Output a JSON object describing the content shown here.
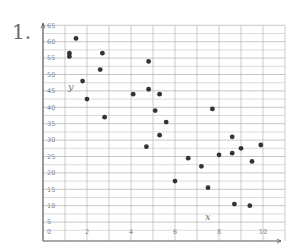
{
  "problem": {
    "number": "1."
  },
  "chart_data": {
    "type": "scatter",
    "title": "",
    "xlabel": "x",
    "ylabel": "y",
    "xlim": [
      0,
      11
    ],
    "ylim": [
      0,
      65
    ],
    "x_ticks": [
      0,
      2,
      4,
      6,
      8,
      10
    ],
    "y_ticks": [
      0,
      5,
      10,
      15,
      20,
      25,
      30,
      35,
      40,
      45,
      50,
      55,
      60,
      65
    ],
    "x_tick_labels": [
      "0",
      "2",
      "4",
      "6",
      "8",
      "10"
    ],
    "y_tick_labels": [
      "0",
      "5",
      "10",
      "15",
      "20",
      "25",
      "30",
      "35",
      "40",
      "45",
      "50",
      "55",
      "60",
      "65"
    ],
    "grid": true,
    "grid_x_step": 1,
    "grid_y_step": 2.5,
    "legend": null,
    "colors": {
      "point": "#333333",
      "grid": "#b8b8b8",
      "axis": "#555555"
    },
    "points": [
      {
        "x": 1.2,
        "y": 56.5
      },
      {
        "x": 1.2,
        "y": 55.5
      },
      {
        "x": 1.5,
        "y": 61
      },
      {
        "x": 1.8,
        "y": 48
      },
      {
        "x": 2.0,
        "y": 42.5
      },
      {
        "x": 2.6,
        "y": 51.5
      },
      {
        "x": 2.7,
        "y": 56.5
      },
      {
        "x": 2.8,
        "y": 37
      },
      {
        "x": 4.1,
        "y": 44
      },
      {
        "x": 4.7,
        "y": 28
      },
      {
        "x": 4.8,
        "y": 54
      },
      {
        "x": 4.8,
        "y": 45.5
      },
      {
        "x": 5.1,
        "y": 39
      },
      {
        "x": 5.3,
        "y": 44
      },
      {
        "x": 5.3,
        "y": 31.5
      },
      {
        "x": 5.6,
        "y": 35.5
      },
      {
        "x": 6.0,
        "y": 17.5
      },
      {
        "x": 6.6,
        "y": 24.5
      },
      {
        "x": 7.2,
        "y": 22
      },
      {
        "x": 7.5,
        "y": 15.5
      },
      {
        "x": 7.7,
        "y": 39.5
      },
      {
        "x": 8.0,
        "y": 25.5
      },
      {
        "x": 8.6,
        "y": 31
      },
      {
        "x": 8.6,
        "y": 26
      },
      {
        "x": 8.7,
        "y": 10.5
      },
      {
        "x": 9.0,
        "y": 27.5
      },
      {
        "x": 9.4,
        "y": 10
      },
      {
        "x": 9.5,
        "y": 23.5
      },
      {
        "x": 9.9,
        "y": 28.5
      }
    ]
  }
}
